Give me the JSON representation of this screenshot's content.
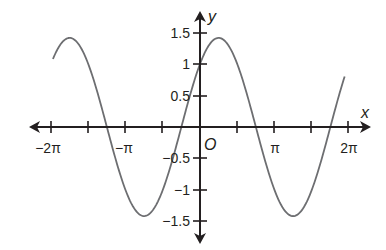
{
  "chart_data": {
    "type": "line",
    "title": "",
    "function": "y = sin x + cos x",
    "xlabel": "x",
    "ylabel": "y",
    "origin_label": "O",
    "xlim": [
      -6.28,
      6.28
    ],
    "ylim": [
      -1.5,
      1.5
    ],
    "grid": false,
    "legend": null,
    "x_ticks": [
      -6.2832,
      -4.7124,
      -3.1416,
      -1.5708,
      0,
      1.5708,
      3.1416,
      4.7124,
      6.2832
    ],
    "x_tick_labels": [
      {
        "value": -6.2832,
        "label": "−2π"
      },
      {
        "value": -3.1416,
        "label": "−π"
      },
      {
        "value": 3.1416,
        "label": "π"
      },
      {
        "value": 6.2832,
        "label": "2π"
      }
    ],
    "y_ticks": [
      -1.5,
      -1,
      -0.5,
      0.5,
      1,
      1.5
    ],
    "y_tick_labels": [
      "−1.5",
      "−1",
      "−0.5",
      "0.5",
      "1",
      "1.5"
    ],
    "series": [
      {
        "name": "curve",
        "color": "#6d6e71",
        "x": [
          -6.2,
          -5.5,
          -4.71,
          -3.93,
          -3.14,
          -2.36,
          -1.57,
          -0.79,
          0,
          0.79,
          1.57,
          2.36,
          3.14,
          3.93,
          4.71,
          5.5,
          6.1
        ],
        "y": [
          1.1,
          1.41,
          1.0,
          0.0,
          -1.0,
          -1.41,
          -1.0,
          0.0,
          1.0,
          1.41,
          1.0,
          0.0,
          -1.0,
          -1.41,
          -1.0,
          0.0,
          0.7
        ]
      }
    ]
  },
  "labels": {
    "x_axis": "x",
    "y_axis": "y",
    "origin": "O",
    "xt_neg2pi": "−2π",
    "xt_negpi": "−π",
    "xt_pi": "π",
    "xt_2pi": "2π",
    "yt_15": "1.5",
    "yt_1": "1",
    "yt_05": "0.5",
    "yt_m05": "−0.5",
    "yt_m1": "−1",
    "yt_m15": "−1.5"
  }
}
